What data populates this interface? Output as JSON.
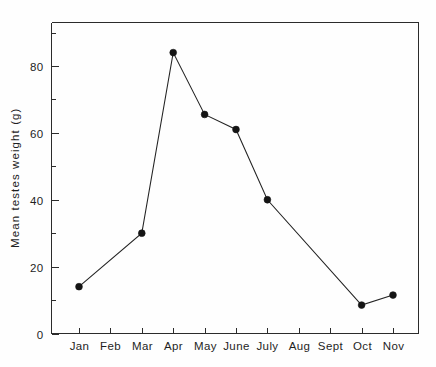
{
  "chart_data": {
    "type": "line",
    "title": "",
    "xlabel": "",
    "ylabel": "Mean  testes  weight  (g)",
    "categories": [
      "Jan",
      "Feb",
      "Mar",
      "Apr",
      "May",
      "June",
      "July",
      "Aug",
      "Sept",
      "Oct",
      "Nov"
    ],
    "x_tick_labels": [
      "Jan",
      "Feb",
      "Mar",
      "Apr",
      "May",
      "June",
      "July",
      "Aug",
      "Sept",
      "Oct",
      "Nov"
    ],
    "y_tick_labels": [
      "0",
      "20",
      "40",
      "60",
      "80"
    ],
    "y_tick_values": [
      0,
      20,
      40,
      60,
      80
    ],
    "y_minor_tick_values": [
      10,
      30,
      50,
      70,
      90
    ],
    "ylim": [
      0,
      93
    ],
    "grid": false,
    "legend": false,
    "legend_position": "none",
    "series": [
      {
        "name": "Mean testes weight",
        "marker": "filled-circle",
        "line_color": "#232323",
        "marker_color": "#141414",
        "points": [
          {
            "x": "Jan",
            "y": 14
          },
          {
            "x": "Mar",
            "y": 30
          },
          {
            "x": "Apr",
            "y": 84
          },
          {
            "x": "May",
            "y": 65.5
          },
          {
            "x": "June",
            "y": 61
          },
          {
            "x": "July",
            "y": 40
          },
          {
            "x": "Oct",
            "y": 8.5
          },
          {
            "x": "Nov",
            "y": 11.5
          }
        ],
        "values_by_category": {
          "Jan": 14,
          "Feb": null,
          "Mar": 30,
          "Apr": 84,
          "May": 65.5,
          "June": 61,
          "July": 40,
          "Aug": null,
          "Sept": null,
          "Oct": 8.5,
          "Nov": 11.5
        }
      }
    ]
  },
  "colors": {
    "axis": "#2b2b2b",
    "line": "#232323",
    "marker": "#141414",
    "background": "#fefefe",
    "text": "#1f1f1f"
  }
}
